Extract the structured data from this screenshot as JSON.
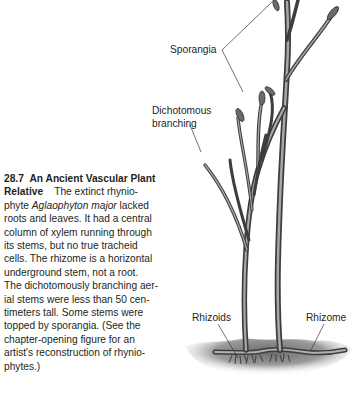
{
  "caption": {
    "figure_number": "28.7",
    "title_part1": "An Ancient Vascular Plant",
    "title_part2": "Relative",
    "lines": [
      "The extinct rhynio-",
      "phyte ",
      "Aglaophyton major",
      " lacked",
      "roots and leaves. It had a central",
      "column of xylem running through",
      "its stems, but no true tracheid",
      "cells. The rhizome is a horizontal",
      "underground stem, not a root.",
      "The dichotomously branching aer-",
      "ial stems were less than 50 cen-",
      "timeters tall. Some stems were",
      "topped by sporangia. (See the",
      "chapter-opening figure for an",
      "artist's reconstruction of rhynio-",
      "phytes.)"
    ]
  },
  "figure": {
    "labels": {
      "sporangia": "Sporangia",
      "dichotomous_line1": "Dichotomous",
      "dichotomous_line2": "branching",
      "rhizoids": "Rhizoids",
      "rhizome": "Rhizome"
    },
    "colors": {
      "stem_dark": "#4a4a4a",
      "stem_mid": "#8a8a8a",
      "stem_light": "#c8c8c8",
      "ground": "#7a7a7a",
      "leader_line": "#333333"
    }
  }
}
